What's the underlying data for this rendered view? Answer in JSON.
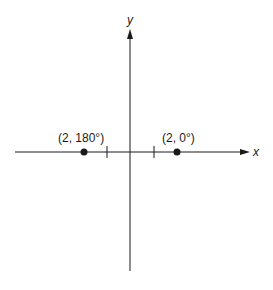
{
  "diagram": {
    "type": "polar-coordinate-points",
    "axes": {
      "x_label": "x",
      "y_label": "y"
    },
    "points": [
      {
        "label": "(2, 180°)",
        "r": 2,
        "theta_deg": 180
      },
      {
        "label": "(2, 0°)",
        "r": 2,
        "theta_deg": 0
      }
    ],
    "tick_marks_at_x": [
      -1,
      1
    ],
    "colors": {
      "ink": "#1a1a1a",
      "background": "#ffffff"
    }
  }
}
